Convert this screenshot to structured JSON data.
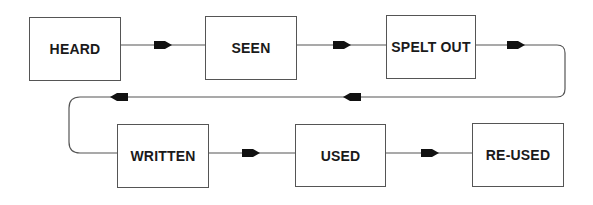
{
  "diagram": {
    "type": "flow",
    "colors": {
      "line": "#555555",
      "arrow": "#111111",
      "box_border": "#555555",
      "text": "#1a1a1a"
    },
    "nodes": [
      {
        "id": "heard",
        "label": "HEARD"
      },
      {
        "id": "seen",
        "label": "SEEN"
      },
      {
        "id": "spelt_out",
        "label": "SPELT OUT"
      },
      {
        "id": "written",
        "label": "WRITTEN"
      },
      {
        "id": "used",
        "label": "USED"
      },
      {
        "id": "re_used",
        "label": "RE-USED"
      }
    ],
    "edges": [
      {
        "from": "heard",
        "to": "seen"
      },
      {
        "from": "seen",
        "to": "spelt_out"
      },
      {
        "from": "spelt_out",
        "to": "written"
      },
      {
        "from": "written",
        "to": "used"
      },
      {
        "from": "used",
        "to": "re_used"
      }
    ]
  }
}
